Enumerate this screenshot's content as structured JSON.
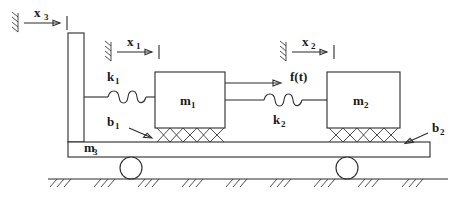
{
  "figure": {
    "type": "mechanical-schematic",
    "background_color": "#ffffff",
    "line_color": "#2b2b2b",
    "text_color": "#1a1a1a"
  },
  "masses": [
    {
      "id": "m1",
      "label": "m",
      "subscript": "1",
      "x": 155,
      "y": 72,
      "width": 70,
      "height": 56
    },
    {
      "id": "m2",
      "label": "m",
      "subscript": "2",
      "x": 327,
      "y": 72,
      "width": 73,
      "height": 56
    },
    {
      "id": "m3",
      "label": "m",
      "subscript": "3",
      "x": 68,
      "y": 136
    }
  ],
  "springs": [
    {
      "id": "k1",
      "label": "k",
      "subscript": "1",
      "label_x": 110,
      "label_y": 79,
      "y": 97,
      "x_start": 98,
      "x_end": 155,
      "coils": 3
    },
    {
      "id": "k2",
      "label": "k",
      "subscript": "2",
      "label_x": 276,
      "label_y": 122,
      "y": 100,
      "x_start": 225,
      "x_end": 327,
      "coils": 3
    }
  ],
  "dampers": [
    {
      "id": "b1",
      "label": "b",
      "subscript": "1",
      "label_x": 110,
      "label_y": 124,
      "x_start": 157,
      "x_end": 224,
      "y_top": 128,
      "y_bottom": 142,
      "cells": 5,
      "leader_from": [
        131,
        128
      ],
      "leader_to": [
        155,
        139
      ]
    },
    {
      "id": "b2",
      "label": "b",
      "subscript": "2",
      "label_x": 435,
      "label_y": 131,
      "x_start": 329,
      "x_end": 398,
      "y_top": 128,
      "y_bottom": 142,
      "cells": 5,
      "leader_from": [
        430,
        136
      ],
      "leader_to": [
        403,
        145
      ]
    }
  ],
  "force": {
    "id": "f",
    "label": "f(t)",
    "label_x": 292,
    "label_y": 80,
    "arrow_y": 83,
    "arrow_x_start": 225,
    "arrow_x_end": 282
  },
  "coordinates": [
    {
      "id": "x3",
      "label": "x",
      "subscript": "3",
      "label_x": 37,
      "label_y": 15,
      "wall_x": 18,
      "wall_y": 22,
      "arrow_y": 23,
      "arrow_x_start": 24,
      "arrow_x_end": 64,
      "tick_x": 68
    },
    {
      "id": "x1",
      "label": "x",
      "subscript": "1",
      "label_x": 130,
      "label_y": 44,
      "wall_x": 111,
      "wall_y": 51,
      "arrow_y": 52,
      "arrow_x_start": 117,
      "arrow_x_end": 155,
      "tick_x": 159
    },
    {
      "id": "x2",
      "label": "x",
      "subscript": "2",
      "label_x": 305,
      "label_y": 44,
      "wall_x": 286,
      "wall_y": 51,
      "arrow_y": 52,
      "arrow_x_start": 292,
      "arrow_x_end": 330,
      "tick_x": 334
    }
  ],
  "platform": {
    "id": "m3-platform",
    "x": 68,
    "y": 142,
    "width": 362,
    "height": 15,
    "column": {
      "x": 68,
      "y": 33,
      "width": 16,
      "height": 109
    }
  },
  "wheels": [
    {
      "id": "wheel-left",
      "cx": 131,
      "cy": 167,
      "r": 11
    },
    {
      "id": "wheel-right",
      "cx": 347,
      "cy": 167,
      "r": 11
    }
  ],
  "ground": {
    "id": "ground",
    "y": 179,
    "x_start": 48,
    "x_end": 448,
    "hatch_groups": 9,
    "strokes_per_group": 3
  }
}
